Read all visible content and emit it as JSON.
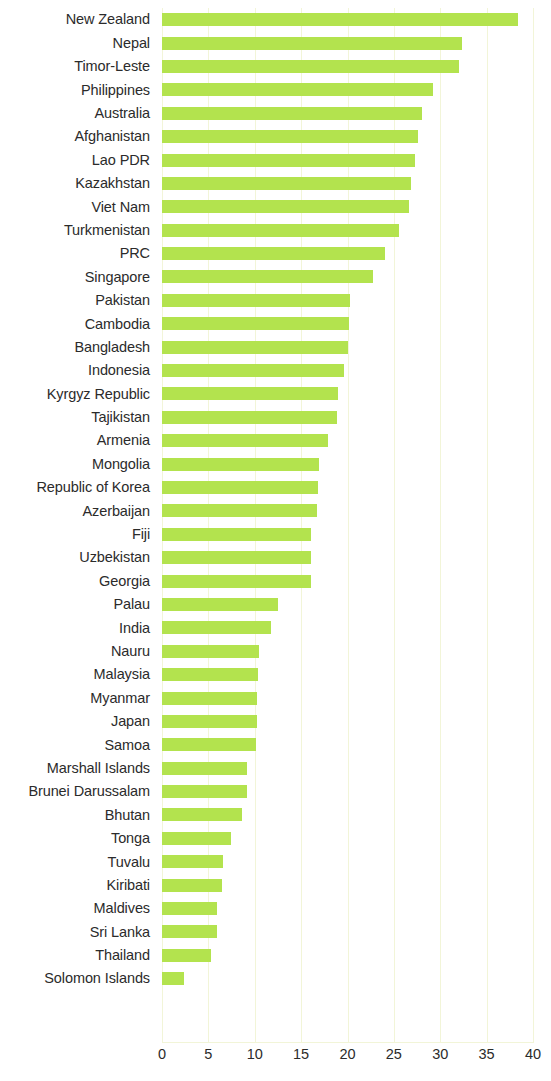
{
  "chart_data": {
    "type": "bar",
    "orientation": "horizontal",
    "title": "",
    "subtitle": "",
    "xlabel": "",
    "ylabel": "",
    "xlim": [
      0,
      40
    ],
    "xticks": [
      0,
      5,
      10,
      15,
      20,
      25,
      30,
      35,
      40
    ],
    "grid": "vertical",
    "legend": "none",
    "bar_color": "#b3e34e",
    "categories": [
      "New Zealand",
      "Nepal",
      "Timor-Leste",
      "Philippines",
      "Australia",
      "Afghanistan",
      "Lao PDR",
      "Kazakhstan",
      "Viet Nam",
      "Turkmenistan",
      "PRC",
      "Singapore",
      "Pakistan",
      "Cambodia",
      "Bangladesh",
      "Indonesia",
      "Kyrgyz Republic",
      "Tajikistan",
      "Armenia",
      "Mongolia",
      "Republic of Korea",
      "Azerbaijan",
      "Fiji",
      "Uzbekistan",
      "Georgia",
      "Palau",
      "India",
      "Nauru",
      "Malaysia",
      "Myanmar",
      "Japan",
      "Samoa",
      "Marshall Islands",
      "Brunei Darussalam",
      "Bhutan",
      "Tonga",
      "Tuvalu",
      "Kiribati",
      "Maldives",
      "Sri Lanka",
      "Thailand",
      "Solomon Islands"
    ],
    "values": [
      38.4,
      32.3,
      32.0,
      29.2,
      28.0,
      27.6,
      27.3,
      26.8,
      26.6,
      25.5,
      24.0,
      22.8,
      20.3,
      20.2,
      20.0,
      19.6,
      19.0,
      18.9,
      17.9,
      16.9,
      16.8,
      16.7,
      16.1,
      16.1,
      16.1,
      12.5,
      11.8,
      10.5,
      10.3,
      10.2,
      10.2,
      10.1,
      9.2,
      9.2,
      8.6,
      7.4,
      6.6,
      6.5,
      5.9,
      5.9,
      5.3,
      2.4
    ]
  }
}
